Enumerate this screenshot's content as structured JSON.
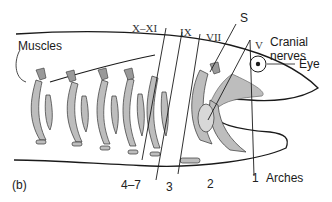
{
  "figure": {
    "panel_label": "(b)",
    "colors": {
      "fill_gray": "#bdbdbd",
      "stroke": "#1a1a1a",
      "background": "#ffffff"
    }
  },
  "labels": {
    "muscles": "Muscles",
    "cranial_nerves_line1": "Cranial",
    "cranial_nerves_line2": "nerves",
    "eye": "Eye",
    "arches": "Arches"
  },
  "nerves": [
    {
      "id": "X-XI",
      "label": "X–XI"
    },
    {
      "id": "IX",
      "label": "IX"
    },
    {
      "id": "VII",
      "label": "VII"
    },
    {
      "id": "S",
      "label": "S"
    },
    {
      "id": "V",
      "label": "V"
    }
  ],
  "arch_numbers": [
    {
      "id": "4-7",
      "label": "4–7"
    },
    {
      "id": "3",
      "label": "3"
    },
    {
      "id": "2",
      "label": "2"
    },
    {
      "id": "1",
      "label": "1"
    }
  ]
}
